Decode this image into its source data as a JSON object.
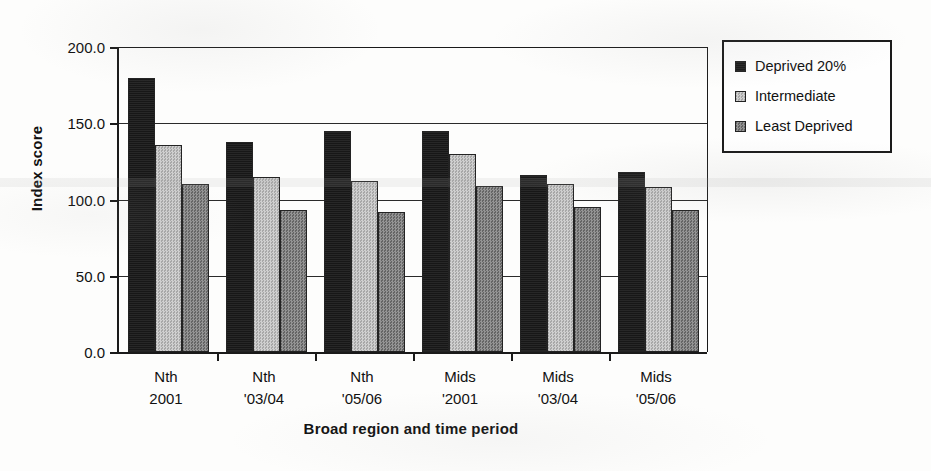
{
  "chart_data": {
    "type": "bar",
    "title": "",
    "subtitle": "",
    "xlabel": "Broad region and time period",
    "ylabel": "Index score",
    "ylim": [
      0,
      200
    ],
    "ytick_values": [
      0,
      50,
      100,
      150,
      200
    ],
    "ytick_labels": [
      "0.0",
      "50.0",
      "100.0",
      "150.0",
      "200.0"
    ],
    "grid": "horizontal",
    "legend_position": "right-outside",
    "categories": [
      "Nth\n2001",
      "Nth\n'03/04",
      "Nth\n'05/06",
      "Mids\n'2001",
      "Mids\n'03/04",
      "Mids\n'05/06"
    ],
    "category_lines": [
      [
        "Nth",
        "2001"
      ],
      [
        "Nth",
        "'03/04"
      ],
      [
        "Nth",
        "'05/06"
      ],
      [
        "Mids",
        "'2001"
      ],
      [
        "Mids",
        "'03/04"
      ],
      [
        "Mids",
        "'05/06"
      ]
    ],
    "series": [
      {
        "name": "Deprived 20%",
        "color": "#171717",
        "values": [
          180,
          138,
          145,
          145,
          116,
          118
        ]
      },
      {
        "name": "Intermediate",
        "color": "#b9b9b9",
        "values": [
          136,
          115,
          112,
          130,
          110,
          108
        ]
      },
      {
        "name": "Least Deprived",
        "color": "#7c7c7c",
        "values": [
          110,
          93,
          92,
          109,
          95,
          93
        ]
      }
    ]
  },
  "legend": {
    "items": [
      {
        "label": "Deprived 20%",
        "swatch": "sw-deprived"
      },
      {
        "label": "Intermediate",
        "swatch": "sw-intermediate"
      },
      {
        "label": "Least Deprived",
        "swatch": "sw-least"
      }
    ]
  }
}
